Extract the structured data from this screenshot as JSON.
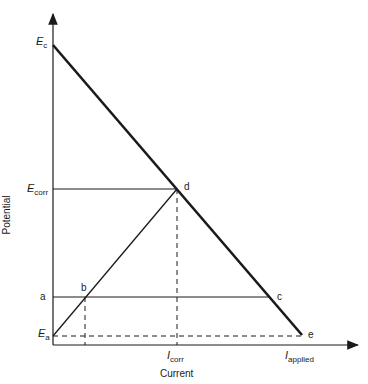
{
  "diagram": {
    "axes": {
      "x_label": "Current",
      "y_label": "Potential"
    },
    "y_ticks": [
      {
        "main": "E",
        "sub": "c"
      },
      {
        "main": "E",
        "sub": "corr"
      },
      {
        "main": "a",
        "sub": ""
      },
      {
        "main": "E",
        "sub": "a"
      }
    ],
    "x_ticks": [
      {
        "main": "I",
        "sub": "corr"
      },
      {
        "main": "I",
        "sub": "applied"
      }
    ],
    "points": [
      "b",
      "c",
      "d",
      "e"
    ],
    "colors": {
      "line": "#1a1a1a",
      "background": "#ffffff"
    }
  }
}
